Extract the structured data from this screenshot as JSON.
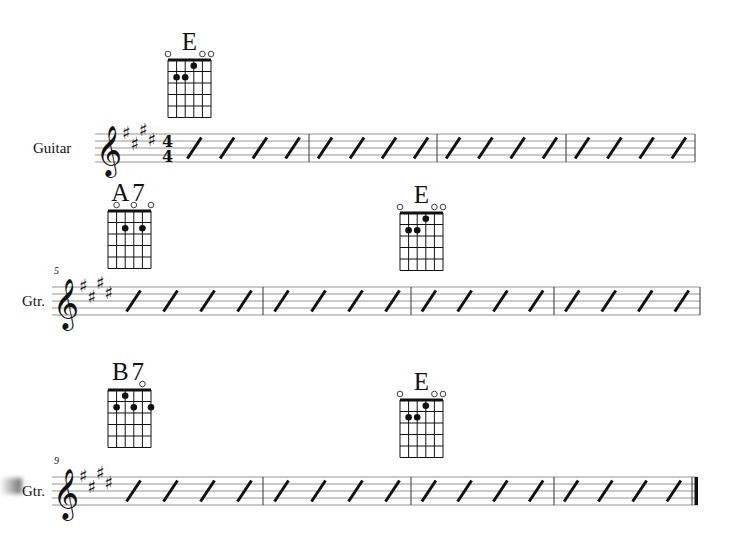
{
  "score": {
    "key_signature": "E major (4 sharps)",
    "time_signature": {
      "top": "4",
      "bottom": "4"
    },
    "systems": [
      {
        "instrument_label": "Guitar",
        "measure_number": "",
        "chords": [
          {
            "name": "E",
            "x": 160,
            "y": 27,
            "open": [
              0,
              4,
              5
            ],
            "dots": [
              {
                "string": 3,
                "fret": 1
              },
              {
                "string": 1,
                "fret": 2
              },
              {
                "string": 2,
                "fret": 2
              }
            ]
          }
        ],
        "staff_top": 134,
        "staff_x0": 95,
        "staff_x1": 695,
        "bars": [
          309,
          437,
          566
        ],
        "final": false
      },
      {
        "instrument_label": "Gtr.",
        "measure_number": "5",
        "chords": [
          {
            "name": "A7",
            "x": 100,
            "y": 178,
            "open": [
              1,
              3,
              5
            ],
            "dots": [
              {
                "string": 2,
                "fret": 2
              },
              {
                "string": 4,
                "fret": 2
              }
            ]
          },
          {
            "name": "E",
            "x": 392,
            "y": 180,
            "open": [
              0,
              4,
              5
            ],
            "dots": [
              {
                "string": 3,
                "fret": 1
              },
              {
                "string": 1,
                "fret": 2
              },
              {
                "string": 2,
                "fret": 2
              }
            ]
          }
        ],
        "staff_top": 287,
        "staff_x0": 52,
        "staff_x1": 700,
        "bars": [
          263,
          411,
          554
        ],
        "final": false
      },
      {
        "instrument_label": "Gtr.",
        "measure_number": "9",
        "chords": [
          {
            "name": "B7",
            "x": 100,
            "y": 357,
            "open": [
              4
            ],
            "dots": [
              {
                "string": 2,
                "fret": 1
              },
              {
                "string": 1,
                "fret": 2
              },
              {
                "string": 3,
                "fret": 2
              },
              {
                "string": 5,
                "fret": 2
              }
            ]
          },
          {
            "name": "E",
            "x": 392,
            "y": 367,
            "open": [
              0,
              4,
              5
            ],
            "dots": [
              {
                "string": 3,
                "fret": 1
              },
              {
                "string": 1,
                "fret": 2
              },
              {
                "string": 2,
                "fret": 2
              }
            ]
          }
        ],
        "staff_top": 477,
        "staff_x0": 52,
        "staff_x1": 697,
        "bars": [
          263,
          411,
          554
        ],
        "final": true
      }
    ],
    "slashes_per_measure": 4
  },
  "colors": {
    "ink": "#111111",
    "staff": "#888888"
  }
}
